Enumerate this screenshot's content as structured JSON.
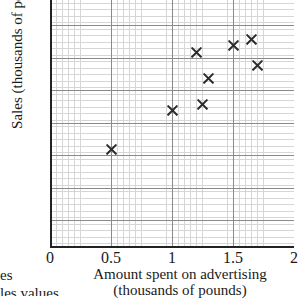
{
  "chart_data": {
    "type": "scatter",
    "title": "",
    "xlabel": "Amount spent on advertising (thousands of pounds)",
    "ylabel": "Sales (thousands of pounds)",
    "xlim": [
      0,
      2
    ],
    "ylim": [
      0,
      198
    ],
    "grid": true,
    "legend": null,
    "x": [
      0.5,
      1.0,
      1.2,
      1.25,
      1.3,
      1.5,
      1.65,
      1.7
    ],
    "y": [
      75,
      105,
      150,
      110,
      130,
      155,
      160,
      140
    ],
    "points": [
      {
        "x": 0.5,
        "y": 75
      },
      {
        "x": 1.0,
        "y": 105
      },
      {
        "x": 1.2,
        "y": 150
      },
      {
        "x": 1.25,
        "y": 110
      },
      {
        "x": 1.3,
        "y": 130
      },
      {
        "x": 1.5,
        "y": 155
      },
      {
        "x": 1.65,
        "y": 160
      },
      {
        "x": 1.7,
        "y": 140
      }
    ],
    "marker": "x",
    "marker_color": "#2b2b2b",
    "xticks": [
      {
        "value": 0,
        "label": "0"
      },
      {
        "value": 0.5,
        "label": "0.5"
      },
      {
        "value": 1,
        "label": "1"
      },
      {
        "value": 1.5,
        "label": "1.5"
      },
      {
        "value": 2,
        "label": "2"
      }
    ],
    "yticks": [
      {
        "value": 50,
        "label": "50"
      },
      {
        "value": 100,
        "label": "100"
      },
      {
        "value": 150,
        "label": "150"
      }
    ]
  },
  "axis_titles": {
    "y": "Sales (thousands of pounds)",
    "x_line1": "Amount spent on advertising",
    "x_line2": "(thousands of pounds)"
  },
  "margin_text": {
    "line1": "es",
    "line2": "les values"
  }
}
